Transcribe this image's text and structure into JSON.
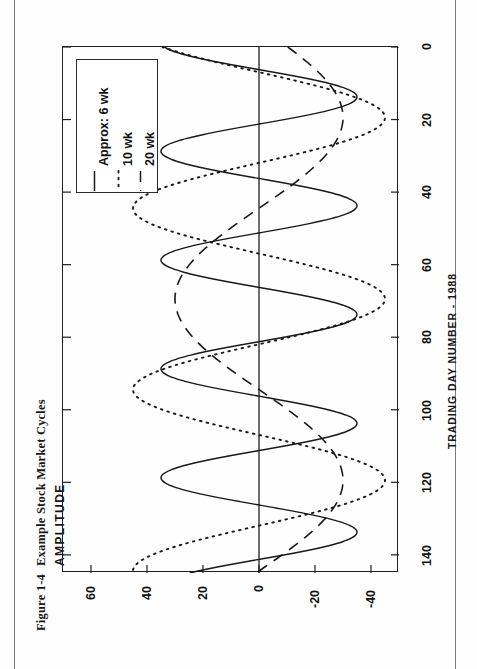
{
  "caption": {
    "figure_number": "Figure 1-4",
    "title": "Example Stock Market Cycles"
  },
  "axes": {
    "y_title": "AMPLITUDE",
    "x_title": "TRADING DAY NUMBER - 1988",
    "x_ticks": [
      "0",
      "20",
      "40",
      "60",
      "80",
      "100",
      "120",
      "140"
    ],
    "y_ticks": [
      "60",
      "40",
      "20",
      "0",
      "-20",
      "-40"
    ]
  },
  "legend": {
    "items": [
      {
        "label": "Approx: 6 wk",
        "style": "solid"
      },
      {
        "label": "10 wk",
        "style": "dotted"
      },
      {
        "label": "20 wk",
        "style": "dashed"
      }
    ]
  },
  "colors": {
    "ink": "#1d1f21",
    "paper": "#fefefe",
    "rule": "#7a7a7a"
  },
  "chart_data": {
    "type": "line",
    "title": "Example Stock Market Cycles",
    "xlabel": "TRADING DAY NUMBER - 1988",
    "ylabel": "AMPLITUDE",
    "xlim": [
      0,
      145
    ],
    "ylim": [
      -50,
      70
    ],
    "xticks": [
      0,
      20,
      40,
      60,
      80,
      100,
      120,
      140
    ],
    "yticks": [
      60,
      40,
      20,
      0,
      -20,
      -40
    ],
    "grid": false,
    "legend_position": "top-left",
    "zero_line": true,
    "orientation": "page rotated 90 degrees counter-clockwise",
    "series": [
      {
        "name": "Approx: 6 wk",
        "style": "solid",
        "description": "short cycle, period about 30 trading days, amplitude about 35",
        "model": {
          "form": "sine",
          "amplitude": 35,
          "period_days": 30,
          "phase_deg": 105,
          "offset": 0
        },
        "x": [
          0,
          5,
          10,
          15,
          20,
          25,
          30,
          35,
          40,
          45,
          50,
          55,
          60,
          65,
          70,
          75,
          80,
          85,
          90,
          95,
          100,
          105,
          110,
          115,
          120,
          125,
          130,
          135,
          140,
          145
        ],
        "y": [
          30,
          8,
          -18,
          -32,
          -34,
          -22,
          2,
          24,
          35,
          33,
          18,
          -7,
          -28,
          -35,
          -30,
          -12,
          12,
          31,
          35,
          26,
          4,
          -20,
          -34,
          -34,
          -20,
          4,
          26,
          35,
          30,
          12
        ]
      },
      {
        "name": "10 wk",
        "style": "dotted",
        "description": "intermediate cycle, period about 50 trading days, amplitude about 45",
        "model": {
          "form": "sine",
          "amplitude": 45,
          "period_days": 50,
          "phase_deg": 130,
          "offset": 0
        },
        "x": [
          0,
          5,
          10,
          15,
          20,
          25,
          30,
          35,
          40,
          45,
          50,
          55,
          60,
          65,
          70,
          75,
          80,
          85,
          90,
          95,
          100,
          105,
          110,
          115,
          120,
          125,
          130,
          135,
          140,
          145
        ],
        "y": [
          18,
          -8,
          -30,
          -40,
          -38,
          -24,
          -2,
          22,
          38,
          45,
          43,
          30,
          10,
          -14,
          -32,
          -42,
          -40,
          -28,
          -8,
          14,
          32,
          42,
          42,
          32,
          14,
          -8,
          -28,
          -40,
          -42,
          -34
        ]
      },
      {
        "name": "20 wk",
        "style": "dashed",
        "description": "long cycle, period about 100 trading days, amplitude about 30",
        "model": {
          "form": "sine",
          "amplitude": 30,
          "period_days": 100,
          "phase_deg": 200,
          "offset": 0
        },
        "x": [
          0,
          5,
          10,
          15,
          20,
          25,
          30,
          35,
          40,
          45,
          50,
          55,
          60,
          65,
          70,
          75,
          80,
          85,
          90,
          95,
          100,
          105,
          110,
          115,
          120,
          125,
          130,
          135,
          140,
          145
        ],
        "y": [
          -12,
          2,
          14,
          24,
          29,
          30,
          26,
          18,
          7,
          -5,
          -17,
          -25,
          -30,
          -30,
          -25,
          -16,
          -4,
          8,
          19,
          27,
          30,
          29,
          23,
          14,
          2,
          -10,
          -21,
          -28,
          -30,
          -28
        ]
      }
    ]
  }
}
